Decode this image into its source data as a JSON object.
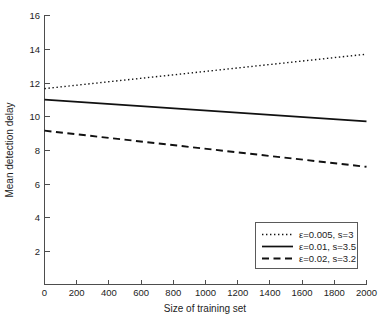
{
  "chart_data": {
    "type": "line",
    "title": "",
    "xlabel": "Size of training set",
    "ylabel": "Mean detection delay",
    "xlim": [
      0,
      2000
    ],
    "ylim": [
      0,
      16
    ],
    "xticks": [
      0,
      200,
      400,
      600,
      800,
      1000,
      1200,
      1400,
      1600,
      1800,
      2000
    ],
    "xticklabels": [
      "0",
      "200",
      "400",
      "600",
      "800",
      "1000",
      "1200",
      "1400",
      "1600",
      "1800",
      "2000"
    ],
    "yticks": [
      2,
      4,
      6,
      8,
      10,
      12,
      14,
      16
    ],
    "yticklabels": [
      "2",
      "4",
      "6",
      "8",
      "10",
      "12",
      "14",
      "16"
    ],
    "grid": false,
    "legend_position": "lower right",
    "x": [
      0,
      2000
    ],
    "series": [
      {
        "name": "ε=0.005, s=3",
        "style": "dotted",
        "color": "#111111",
        "values": [
          11.65,
          13.7
        ]
      },
      {
        "name": "ε=0.01, s=3.5",
        "style": "solid",
        "color": "#111111",
        "values": [
          11.0,
          9.7
        ]
      },
      {
        "name": "ε=0.02, s=3.2",
        "style": "dashed",
        "color": "#111111",
        "values": [
          9.15,
          7.0
        ]
      }
    ]
  },
  "axes": {
    "x_label": "Size of training set",
    "y_label": "Mean detection delay",
    "x_tick_labels": [
      "0",
      "200",
      "400",
      "600",
      "800",
      "1000",
      "1200",
      "1400",
      "1600",
      "1800",
      "2000"
    ],
    "y_tick_labels": [
      "16",
      "14",
      "12",
      "10",
      "8",
      "6",
      "4",
      "2"
    ]
  },
  "legend": {
    "entries": [
      {
        "label": "ε=0.005, s=3",
        "style": "dotted"
      },
      {
        "label": "ε=0.01, s=3.5",
        "style": "solid"
      },
      {
        "label": "ε=0.02, s=3.2",
        "style": "dashed"
      }
    ]
  },
  "colors": {
    "line": "#111111",
    "axis": "#4d4d4d",
    "text": "#1d1d1d",
    "background": "#ffffff"
  }
}
